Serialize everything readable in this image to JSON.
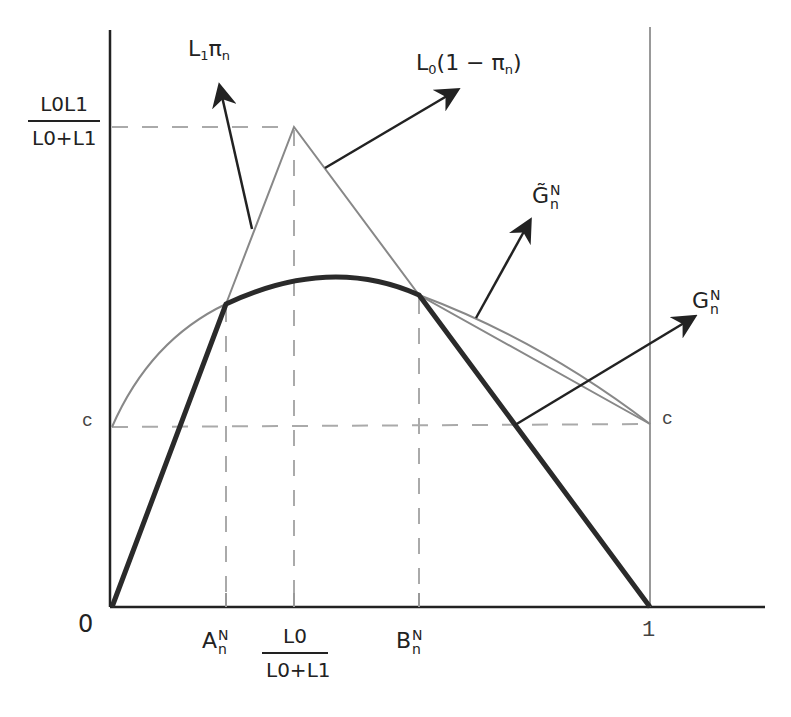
{
  "diagram": {
    "type": "economic-function-plot",
    "axes": {
      "origin_label": "0",
      "x_end_label": "1",
      "y_fraction_num": "L0L1",
      "y_fraction_den": "L0+L1",
      "c_left_label": "c",
      "c_right_label": "c"
    },
    "x_ticks": {
      "a": {
        "base": "A",
        "sup": "N",
        "sub": "n"
      },
      "mid_num": "L0",
      "mid_den": "L0+L1",
      "b": {
        "base": "B",
        "sup": "N",
        "sub": "n"
      }
    },
    "curve_labels": {
      "l1pi": {
        "base": "L",
        "sub": "1",
        "rest": "π",
        "rest_sub": "n"
      },
      "l0": {
        "base": "L",
        "sub": "0",
        "rest": "(1 − π",
        "rest_sub": "n",
        "close": ")"
      },
      "g_tilde": {
        "base": "G̃",
        "sup": "N",
        "sub": "n"
      },
      "g": {
        "base": "G",
        "sup": "N",
        "sub": "n"
      }
    },
    "colors": {
      "axis": "#222222",
      "thin_curve": "#888888",
      "thick_curve": "#2a2a2a",
      "dashed": "#aaaaaa",
      "arrow": "#222222"
    }
  }
}
